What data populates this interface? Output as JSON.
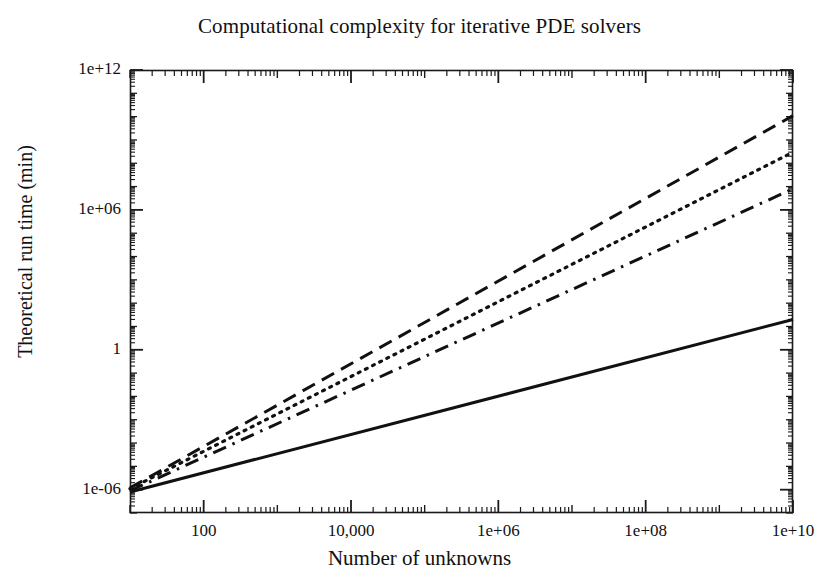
{
  "chart": {
    "title": "Computational complexity for iterative PDE solvers",
    "xlabel": "Number of unknowns",
    "ylabel": "Theoretical run time (min)"
  },
  "axis": {
    "x_ticks": [
      {
        "label": "100",
        "value": 100
      },
      {
        "label": "10,000",
        "value": 10000
      },
      {
        "label": "1e+06",
        "value": 1000000
      },
      {
        "label": "1e+08",
        "value": 100000000
      },
      {
        "label": "1e+10",
        "value": 10000000000
      }
    ],
    "y_ticks": [
      {
        "label": "1e+12",
        "value": 1000000000000
      },
      {
        "label": "1e+06",
        "value": 1000000
      },
      {
        "label": "1",
        "value": 1
      },
      {
        "label": "1e-06",
        "value": 1e-06
      }
    ]
  },
  "chart_data": {
    "type": "line",
    "title": "Computational complexity for iterative PDE solvers",
    "xlabel": "Number of unknowns",
    "ylabel": "Theoretical run time (min)",
    "xscale": "log",
    "yscale": "log",
    "xlim": [
      10,
      10000000000
    ],
    "ylim": [
      1e-07,
      1000000000000.0
    ],
    "grid": false,
    "legend": "none",
    "xticklabels": [
      "100",
      "10,000",
      "1e+06",
      "1e+08",
      "1e+10"
    ],
    "yticklabels": [
      "1e+12",
      "1e+06",
      "1",
      "1e-06"
    ],
    "series": [
      {
        "name": "series-1-dashed",
        "style": "dashed",
        "color": "#111111",
        "x": [
          10,
          10000000000
        ],
        "y": [
          1.2e-06,
          11000000000.0
        ],
        "slope_decades_per_decade": 1.78
      },
      {
        "name": "series-2-dotted",
        "style": "dotted",
        "color": "#111111",
        "x": [
          10,
          10000000000
        ],
        "y": [
          1.1e-06,
          300000000.0
        ],
        "slope_decades_per_decade": 1.58
      },
      {
        "name": "series-3-dashdot",
        "style": "dashdot",
        "color": "#111111",
        "x": [
          10,
          10000000000
        ],
        "y": [
          9e-07,
          8000000.0
        ],
        "slope_decades_per_decade": 1.39
      },
      {
        "name": "series-4-solid",
        "style": "solid",
        "color": "#111111",
        "x": [
          10,
          10000000000
        ],
        "y": [
          8e-07,
          20.0
        ],
        "slope_decades_per_decade": 0.93
      }
    ]
  },
  "geometry": {
    "plot_left": 130,
    "plot_top": 70,
    "plot_right": 793,
    "plot_bottom": 513
  }
}
